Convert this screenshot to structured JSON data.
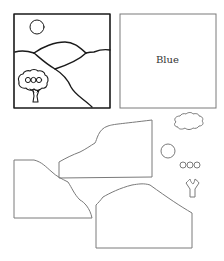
{
  "canvas": {
    "width": 224,
    "height": 261,
    "background": "#ffffff"
  },
  "colors": {
    "stroke_main": "#1a1a1a",
    "stroke_cutout": "#7a7a7a",
    "text": "#333333"
  },
  "scene_card": {
    "description": "Landscape picture with sun, hills, and tree",
    "elements": [
      "sun",
      "hills",
      "tree"
    ]
  },
  "blank_card": {
    "label": "Blue"
  },
  "cutout_pieces": {
    "items": [
      "hill-piece-upper",
      "hill-piece-left",
      "hill-piece-lower",
      "cloud",
      "sun-circle",
      "fruit-circles",
      "tree-trunk"
    ]
  }
}
